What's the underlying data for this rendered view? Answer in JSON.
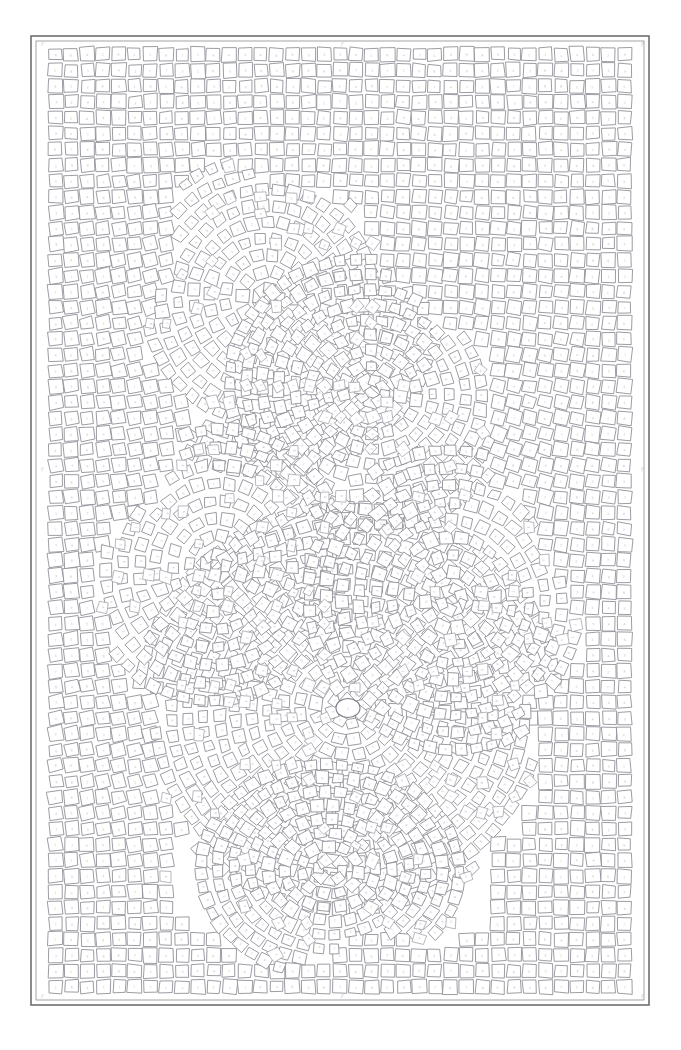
{
  "page": {
    "background_color": "#ffffff",
    "width": 681,
    "height": 1050
  },
  "frame": {
    "outer_stroke": "#6f6f6f",
    "inner_stroke": "#8d8d8d",
    "outer_rect": {
      "x": 31,
      "y": 36,
      "width": 618,
      "height": 969
    },
    "inner_rect": {
      "x": 36,
      "y": 41,
      "width": 608,
      "height": 959
    }
  },
  "registration_marks": {
    "label": "corner and edge registration marks",
    "glyph": "┌",
    "color": "#bdbdbd",
    "positions": [
      {
        "name": "mark-top-left",
        "x": 40,
        "y": 45
      },
      {
        "name": "mark-top-center",
        "x": 340,
        "y": 45
      },
      {
        "name": "mark-top-right",
        "x": 640,
        "y": 45
      },
      {
        "name": "mark-left-middle",
        "x": 40,
        "y": 470
      },
      {
        "name": "mark-right-middle",
        "x": 640,
        "y": 470
      },
      {
        "name": "mark-bottom-left",
        "x": 40,
        "y": 997
      },
      {
        "name": "mark-bottom-center",
        "x": 340,
        "y": 997
      },
      {
        "name": "mark-bottom-right",
        "x": 640,
        "y": 997
      }
    ]
  },
  "mosaic": {
    "style": "tesserae / andamento mosaic line art",
    "tile_fill": "#ffffff",
    "tile_stroke": "#8a8a92",
    "glyph_color": "#b9b9c0",
    "tile_size": 13.6,
    "tile_gap": 2.2,
    "background_field": "regular orthogonal tile grid",
    "figure_field": "curved flowing tile bands following subject contours",
    "number_labels": "each tile carries a faint small color-index numeral",
    "number_range": [
      1,
      9
    ],
    "focal_point": {
      "name": "eye",
      "cx": 348,
      "cy": 708,
      "rx": 12,
      "ry": 9.5
    }
  },
  "chart_data": {
    "type": "heatmap",
    "xlabel": "",
    "ylabel": "",
    "grid": false,
    "legend": "none",
    "categories": [
      "1",
      "2",
      "3",
      "4",
      "5",
      "6",
      "7",
      "8",
      "9"
    ],
    "values": [
      1,
      2,
      3,
      4,
      5,
      6,
      7,
      8,
      9
    ],
    "note": "Tile numerals are sub-pixel in the source image; rendered as faint marks."
  }
}
